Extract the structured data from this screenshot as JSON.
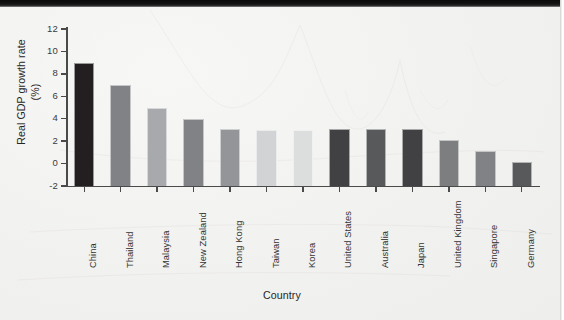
{
  "chart_data": {
    "type": "bar",
    "title": "",
    "xlabel": "Country",
    "ylabel": "Real GDP growth rate\n(%)",
    "ylabel_line1": "Real GDP growth rate",
    "ylabel_line2": "(%)",
    "categories": [
      "China",
      "Thailand",
      "Malaysia",
      "New Zealand",
      "Hong Kong",
      "Taiwan",
      "Korea",
      "United States",
      "Australia",
      "Japan",
      "United Kingdom",
      "Germany",
      "Singapore"
    ],
    "order": [
      "China",
      "Thailand",
      "Malaysia",
      "New Zealand",
      "Hong Kong",
      "Taiwan",
      "Korea",
      "United States",
      "Australia",
      "Japan",
      "United Kingdom",
      "Singapore",
      "Germany"
    ],
    "values": [
      9.0,
      7.0,
      5.0,
      4.0,
      3.1,
      3.0,
      3.0,
      3.1,
      3.1,
      3.1,
      2.1,
      1.1,
      0.1
    ],
    "bar_colors": [
      "#231f20",
      "#808285",
      "#a7a9ac",
      "#808285",
      "#939598",
      "#d1d3d4",
      "#d8dad9",
      "#414042",
      "#58595b",
      "#414042",
      "#808285",
      "#808285",
      "#58595b"
    ],
    "ylim": [
      -2,
      12
    ],
    "yticks": [
      12,
      10,
      8,
      6,
      4,
      2,
      0,
      -2
    ],
    "ytick_labels": [
      "12",
      "10",
      "8",
      "6",
      "4",
      "2",
      "0",
      "-2"
    ],
    "grid": false,
    "legend": null,
    "bars": [
      {
        "label": "China",
        "value": 9.0,
        "color": "#231f20"
      },
      {
        "label": "Thailand",
        "value": 7.0,
        "color": "#808285"
      },
      {
        "label": "Malaysia",
        "value": 5.0,
        "color": "#a7a9ac"
      },
      {
        "label": "New Zealand",
        "value": 4.0,
        "color": "#808285"
      },
      {
        "label": "Hong Kong",
        "value": 3.1,
        "color": "#939598"
      },
      {
        "label": "Taiwan",
        "value": 3.0,
        "color": "#d1d3d4"
      },
      {
        "label": "Korea",
        "value": 3.0,
        "color": "#dcdedd"
      },
      {
        "label": "United States",
        "value": 3.1,
        "color": "#414042"
      },
      {
        "label": "Australia",
        "value": 3.1,
        "color": "#58595b"
      },
      {
        "label": "Japan",
        "value": 3.1,
        "color": "#414042"
      },
      {
        "label": "United Kingdom",
        "value": 2.1,
        "color": "#7c7e80"
      },
      {
        "label": "Singapore",
        "value": 1.1,
        "color": "#808285"
      },
      {
        "label": "Germany",
        "value": 0.1,
        "color": "#58595b"
      }
    ]
  },
  "axis": {
    "y_title_line1": "Real GDP growth rate",
    "y_title_line2": "(%)",
    "x_title": "Country"
  }
}
